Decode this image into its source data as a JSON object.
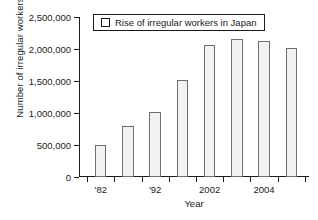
{
  "chart_data": {
    "type": "bar",
    "title": "",
    "xlabel": "Year",
    "ylabel": "Number of irregular workers",
    "legend": [
      {
        "label": "Rise of irregular workers in Japan",
        "marker": "open-square"
      }
    ],
    "legend_position": "top-center",
    "grid": false,
    "ylim": [
      0,
      2500000
    ],
    "ytick_values": [
      0,
      500000,
      1000000,
      1500000,
      2000000,
      2500000
    ],
    "ytick_labels": [
      "0",
      "500,000",
      "1,000,000",
      "1,500,000",
      "2,000,000",
      "2,500,000"
    ],
    "categories": [
      "'82",
      "",
      "'92",
      "",
      "2002",
      "",
      "2004",
      ""
    ],
    "xtick_labels": [
      "'82",
      "'92",
      "2002",
      "2004"
    ],
    "xtick_label_positions": [
      0,
      2,
      4,
      6
    ],
    "values": [
      500000,
      790000,
      1010000,
      1510000,
      2060000,
      2160000,
      2130000,
      2010000
    ],
    "bar_fill": "#f2f2f2",
    "bar_edge": "#6e6e6e",
    "axis_color": "#1a1a1a"
  }
}
